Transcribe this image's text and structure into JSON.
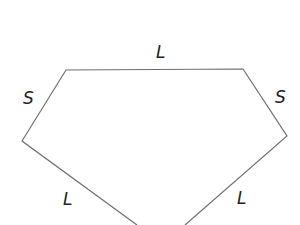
{
  "diagram": {
    "type": "polygon-kite",
    "line_color": "#6e6e6e",
    "labels": {
      "top": "L",
      "upper_left": "S",
      "upper_right": "S",
      "lower_left": "L",
      "lower_right": "L"
    }
  }
}
